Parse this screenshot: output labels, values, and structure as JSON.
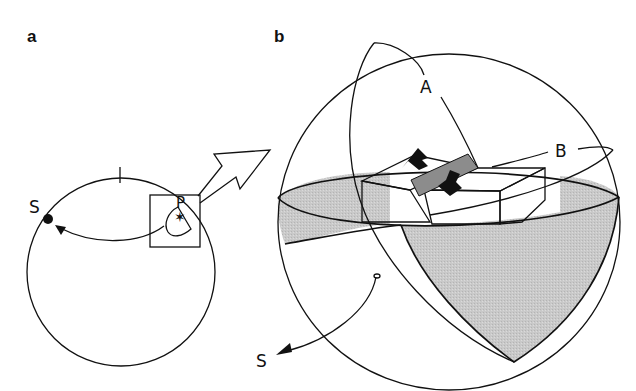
{
  "panels": {
    "a": {
      "label": "a",
      "source_label": "S",
      "point_label": "P"
    },
    "b": {
      "label": "b",
      "plane_a_label": "A",
      "plane_b_label": "B",
      "source_label": "S"
    }
  },
  "colors": {
    "line": "#111111",
    "shade": "#c6c6c6",
    "fault": "#8c8c8c",
    "arrow": "#111111",
    "block": "#ffffff"
  }
}
